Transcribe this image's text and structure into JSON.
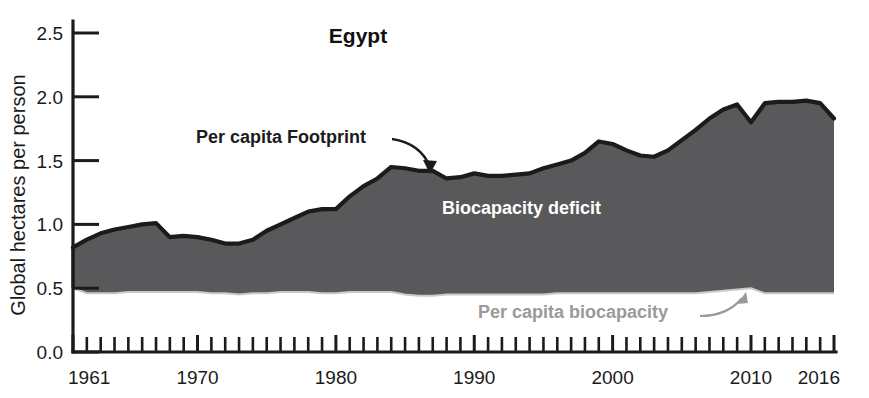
{
  "chart_data": {
    "type": "area",
    "title": "Egypt",
    "xlabel": "",
    "ylabel": "Global hectares per person",
    "xlim": [
      1961,
      2016
    ],
    "ylim": [
      0.0,
      2.5
    ],
    "grid": false,
    "legend_position": "inline-annotations",
    "y_ticks": [
      "0.0",
      "0.5",
      "1.0",
      "1.5",
      "2.0",
      "2.5"
    ],
    "y_tick_values": [
      0.0,
      0.5,
      1.0,
      1.5,
      2.0,
      2.5
    ],
    "x_ticks": [
      "1961",
      "1970",
      "1980",
      "1990",
      "2000",
      "2010",
      "2016"
    ],
    "x_tick_values": [
      1961,
      1970,
      1980,
      1990,
      2000,
      2010,
      2016
    ],
    "x_minor_tick_interval": 1,
    "annotations": [
      {
        "id": "footprint",
        "text": "Per capita Footprint",
        "color": "#1b1b1b"
      },
      {
        "id": "deficit",
        "text": "Biocapacity deficit",
        "color": "#ffffff"
      },
      {
        "id": "biocapacity",
        "text": "Per capita biocapacity",
        "color": "#9a9a9a"
      }
    ],
    "fill_color": "#59595b",
    "line_color": "#1b1b1b",
    "x": [
      1961,
      1962,
      1963,
      1964,
      1965,
      1966,
      1967,
      1968,
      1969,
      1970,
      1971,
      1972,
      1973,
      1974,
      1975,
      1976,
      1977,
      1978,
      1979,
      1980,
      1981,
      1982,
      1983,
      1984,
      1985,
      1986,
      1987,
      1988,
      1989,
      1990,
      1991,
      1992,
      1993,
      1994,
      1995,
      1996,
      1997,
      1998,
      1999,
      2000,
      2001,
      2002,
      2003,
      2004,
      2005,
      2006,
      2007,
      2008,
      2009,
      2010,
      2011,
      2012,
      2013,
      2014,
      2015,
      2016
    ],
    "series": [
      {
        "name": "Per capita Footprint",
        "values": [
          0.82,
          0.88,
          0.93,
          0.96,
          0.98,
          1.0,
          1.01,
          0.9,
          0.91,
          0.9,
          0.88,
          0.85,
          0.85,
          0.88,
          0.95,
          1.0,
          1.05,
          1.1,
          1.12,
          1.12,
          1.22,
          1.3,
          1.36,
          1.45,
          1.44,
          1.42,
          1.42,
          1.36,
          1.37,
          1.4,
          1.38,
          1.38,
          1.39,
          1.4,
          1.44,
          1.47,
          1.5,
          1.56,
          1.65,
          1.63,
          1.58,
          1.54,
          1.53,
          1.58,
          1.66,
          1.74,
          1.83,
          1.9,
          1.94,
          1.8,
          1.95,
          1.96,
          1.96,
          1.97,
          1.95,
          1.83
        ]
      },
      {
        "name": "Per capita biocapacity",
        "values": [
          0.5,
          0.46,
          0.46,
          0.46,
          0.47,
          0.47,
          0.47,
          0.47,
          0.47,
          0.47,
          0.46,
          0.46,
          0.45,
          0.46,
          0.46,
          0.47,
          0.47,
          0.47,
          0.46,
          0.46,
          0.47,
          0.47,
          0.47,
          0.47,
          0.45,
          0.44,
          0.44,
          0.45,
          0.45,
          0.45,
          0.45,
          0.45,
          0.45,
          0.45,
          0.45,
          0.46,
          0.46,
          0.46,
          0.46,
          0.46,
          0.46,
          0.46,
          0.46,
          0.46,
          0.46,
          0.46,
          0.47,
          0.48,
          0.49,
          0.5,
          0.46,
          0.46,
          0.46,
          0.46,
          0.46,
          0.46
        ]
      }
    ]
  }
}
